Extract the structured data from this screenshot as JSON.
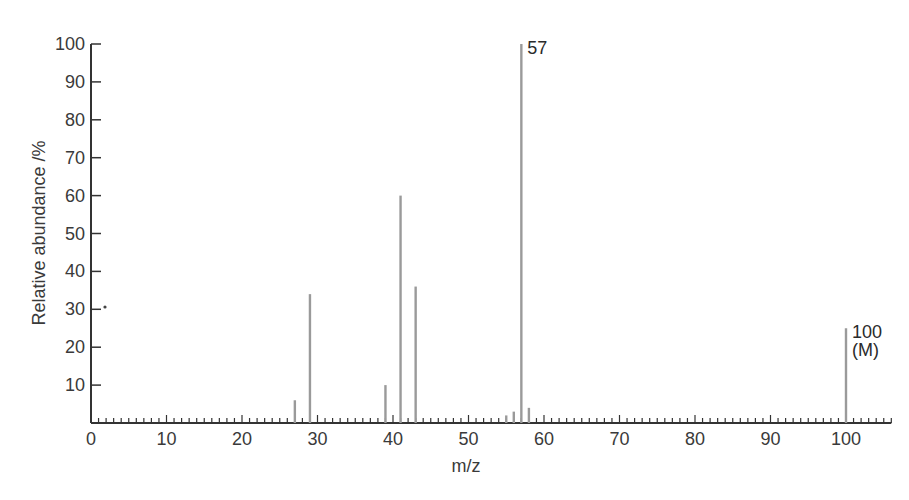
{
  "chart_data": {
    "type": "bar",
    "subtype": "mass-spectrum-stick",
    "title": "",
    "xlabel": "m/z",
    "ylabel": "Relative abundance /%",
    "xlim": [
      0,
      106
    ],
    "ylim": [
      0,
      100
    ],
    "x_ticks": [
      0,
      10,
      20,
      30,
      40,
      50,
      60,
      70,
      80,
      90,
      100
    ],
    "y_ticks": [
      10,
      20,
      30,
      40,
      50,
      60,
      70,
      80,
      90,
      100
    ],
    "x_tick_labels": [
      "0",
      "10",
      "20",
      "30",
      "40",
      "50",
      "60",
      "70",
      "80",
      "90",
      "100"
    ],
    "y_tick_labels": [
      "10",
      "20",
      "30",
      "40",
      "50",
      "60",
      "70",
      "80",
      "90",
      "100"
    ],
    "grid": false,
    "legend": null,
    "peaks": [
      {
        "mz": 27,
        "abundance": 6
      },
      {
        "mz": 29,
        "abundance": 34
      },
      {
        "mz": 39,
        "abundance": 10
      },
      {
        "mz": 41,
        "abundance": 60
      },
      {
        "mz": 43,
        "abundance": 36
      },
      {
        "mz": 55,
        "abundance": 2
      },
      {
        "mz": 56,
        "abundance": 3
      },
      {
        "mz": 57,
        "abundance": 100
      },
      {
        "mz": 58,
        "abundance": 4
      },
      {
        "mz": 100,
        "abundance": 25
      }
    ],
    "annotations": [
      {
        "mz": 57,
        "text": "57"
      },
      {
        "mz": 100,
        "text": "100",
        "subtext": "(M)"
      }
    ],
    "colors": {
      "peak": "#9a9a9a",
      "axis": "#333333",
      "text": "#3a3a3a"
    }
  }
}
